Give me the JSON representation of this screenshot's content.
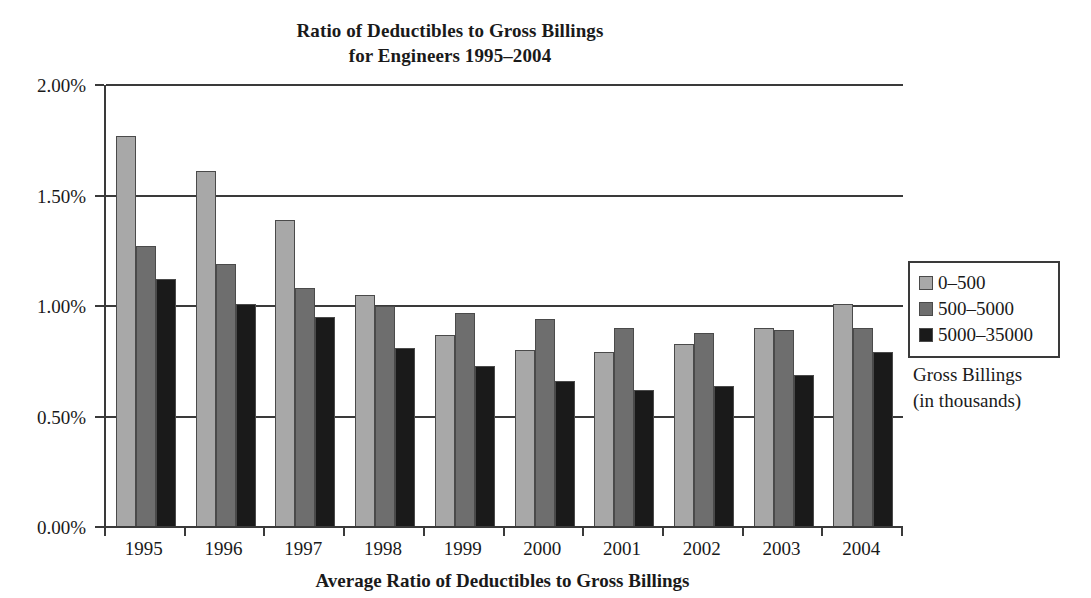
{
  "chart_data": {
    "type": "bar",
    "title": "Ratio of Deductibles to Gross Billings for Engineers 1995–2004",
    "title_lines": [
      "Ratio of Deductibles to Gross Billings",
      "for Engineers 1995–2004"
    ],
    "xlabel": "Average Ratio of Deductibles to Gross Billings",
    "ylabel": "",
    "ylim": [
      0,
      2.0
    ],
    "ytick_labels": [
      "0.00%",
      "0.50%",
      "1.00%",
      "1.50%",
      "2.00%"
    ],
    "ytick_values": [
      0.0,
      0.5,
      1.0,
      1.5,
      2.0
    ],
    "grid": true,
    "legend_position": "right",
    "legend_title_lines": [
      "Gross Billings",
      "(in thousands)"
    ],
    "categories": [
      "1995",
      "1996",
      "1997",
      "1998",
      "1999",
      "2000",
      "2001",
      "2002",
      "2003",
      "2004"
    ],
    "series": [
      {
        "name": "0–500",
        "color": "#a8a8a8",
        "values": [
          1.77,
          1.61,
          1.39,
          1.05,
          0.87,
          0.8,
          0.79,
          0.83,
          0.9,
          1.01
        ]
      },
      {
        "name": "500–5000",
        "color": "#6e6e6e",
        "values": [
          1.27,
          1.19,
          1.08,
          1.0,
          0.97,
          0.94,
          0.9,
          0.88,
          0.89,
          0.9
        ]
      },
      {
        "name": "5000–35000",
        "color": "#1a1a1a",
        "values": [
          1.12,
          1.01,
          0.95,
          0.81,
          0.73,
          0.66,
          0.62,
          0.64,
          0.69,
          0.79
        ]
      }
    ]
  },
  "colors": {
    "axis": "#3a3a3a",
    "bar_outline": "#4a4a4a",
    "background": "#ffffff",
    "text": "#1a1a1a"
  }
}
